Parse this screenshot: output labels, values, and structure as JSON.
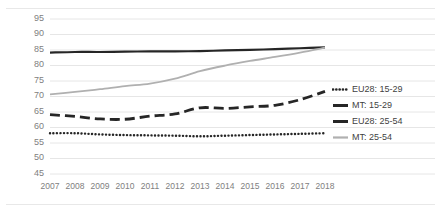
{
  "chart_data": {
    "type": "line",
    "title": "",
    "xlabel": "",
    "ylabel": "",
    "categories": [
      "2007",
      "2008",
      "2009",
      "2010",
      "2011",
      "2012",
      "2013",
      "2014",
      "2015",
      "2016",
      "2017",
      "2018"
    ],
    "x": [
      2007,
      2008,
      2009,
      2010,
      2011,
      2012,
      2013,
      2014,
      2015,
      2016,
      2017,
      2018
    ],
    "ylim": [
      45,
      95
    ],
    "yticks": [
      45,
      50,
      55,
      60,
      65,
      70,
      75,
      80,
      85,
      90,
      95
    ],
    "grid": true,
    "legend_position": "right",
    "series": [
      {
        "name": "EU28: 15-29",
        "style": "dotted",
        "color": "#262626",
        "values": [
          58.0,
          58.0,
          57.6,
          57.4,
          57.3,
          57.2,
          57.0,
          57.2,
          57.4,
          57.6,
          57.8,
          58.0
        ]
      },
      {
        "name": "MT: 15-29",
        "style": "dashed",
        "color": "#262626",
        "values": [
          64.0,
          63.4,
          62.6,
          62.5,
          63.5,
          64.2,
          66.2,
          66.0,
          66.5,
          67.0,
          68.8,
          71.5
        ]
      },
      {
        "name": "EU28: 25-54",
        "style": "solid-thick",
        "color": "#262626",
        "values": [
          84.0,
          84.2,
          84.2,
          84.3,
          84.4,
          84.4,
          84.5,
          84.7,
          84.9,
          85.1,
          85.4,
          85.7
        ]
      },
      {
        "name": "MT: 25-54",
        "style": "solid-light",
        "color": "#b0b0b0",
        "values": [
          70.5,
          71.3,
          72.2,
          73.2,
          74.0,
          75.6,
          78.0,
          79.8,
          81.3,
          82.6,
          84.0,
          85.6
        ]
      }
    ]
  },
  "axis": {
    "y_tick_labels": [
      "95",
      "90",
      "85",
      "80",
      "75",
      "70",
      "65",
      "60",
      "55",
      "50",
      "45"
    ],
    "x_tick_labels": [
      "2007",
      "2008",
      "2009",
      "2010",
      "2011",
      "2012",
      "2013",
      "2014",
      "2015",
      "2016",
      "2017",
      "2018"
    ]
  },
  "legend": {
    "items": [
      {
        "label": "EU28: 15-29",
        "marker": "dotted-line-marker"
      },
      {
        "label": "MT: 15-29",
        "marker": "dashed-line-marker"
      },
      {
        "label": "EU28: 25-54",
        "marker": "solid-thick-line-marker"
      },
      {
        "label": "MT: 25-54",
        "marker": "solid-light-line-marker"
      }
    ]
  },
  "colors": {
    "gridline": "#e6e6e6",
    "frame": "#e8e8e8",
    "tick_text": "#808080",
    "legend_text": "#3f3f3f",
    "dark_series": "#262626",
    "light_series": "#b0b0b0",
    "background": "#ffffff"
  }
}
